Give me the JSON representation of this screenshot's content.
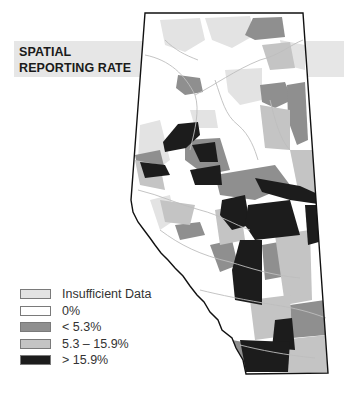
{
  "title": {
    "line1": "SPATIAL",
    "line2": "REPORTING RATE"
  },
  "colors": {
    "banner": "#e6e6e6",
    "insufficient": "#e3e3e3",
    "zero": "#ffffff",
    "low": "#8f8f8f",
    "mid": "#c4c4c4",
    "high": "#1c1c1c",
    "rivers": "#bdbdbd",
    "border": "#111111"
  },
  "legend": {
    "items": [
      {
        "label": "Insufficient Data",
        "color": "#e3e3e3"
      },
      {
        "label": "0%",
        "color": "#ffffff"
      },
      {
        "label": "< 5.3%",
        "color": "#8f8f8f"
      },
      {
        "label": "5.3 – 15.9%",
        "color": "#c4c4c4"
      },
      {
        "label": "> 15.9%",
        "color": "#1c1c1c"
      }
    ]
  }
}
